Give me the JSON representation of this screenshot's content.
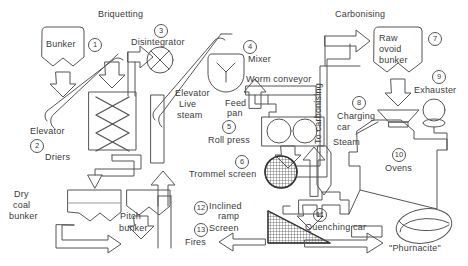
{
  "diagram": {
    "title_left": "Briquetting",
    "title_right": "Carbonising",
    "stroke_color": "#555555",
    "text_color": "#3a3a3a",
    "background": "#ffffff",
    "width": 468,
    "height": 266
  },
  "sections": [
    {
      "name": "briquetting",
      "label": "Briquetting",
      "x": 98,
      "y": 9
    },
    {
      "name": "carbonising",
      "label": "Carbonising",
      "x": 335,
      "y": 9
    }
  ],
  "equipment": [
    {
      "key": "bunker",
      "number": "1",
      "label": "Bunker",
      "shape": "bunker-hopper"
    },
    {
      "key": "elevator1",
      "number": "",
      "label": "Elevator",
      "shape": "inclined-belt"
    },
    {
      "key": "driers",
      "number": "2",
      "label": "Driers",
      "shape": "lattice-box"
    },
    {
      "key": "disintegrator",
      "number": "3",
      "label": "Disintegrator",
      "shape": "circle-cross"
    },
    {
      "key": "elevator2",
      "number": "",
      "label": "Elevator",
      "shape": "inclined-belt"
    },
    {
      "key": "mixer",
      "number": "4",
      "label": "Mixer",
      "shape": "shield-y"
    },
    {
      "key": "live_steam",
      "number": "",
      "label": "Live\nsteam",
      "shape": "up-arrow"
    },
    {
      "key": "worm_conveyor",
      "number": "",
      "label": "Worm conveyor",
      "shape": "long-bar"
    },
    {
      "key": "feed_pan",
      "number": "",
      "label": "Feed\npan",
      "shape": "duct"
    },
    {
      "key": "roll_press",
      "number": "5",
      "label": "Roll press",
      "shape": "two-rolls-box"
    },
    {
      "key": "trommel",
      "number": "6",
      "label": "Trommel screen",
      "shape": "mesh-circle"
    },
    {
      "key": "dry_coal",
      "number": "",
      "label": "Dry\ncoal\nbunker",
      "shape": "bunker-hopper"
    },
    {
      "key": "pitch_bunker",
      "number": "",
      "label": "Pitch\nbunker",
      "shape": "bunker-hopper"
    },
    {
      "key": "raw_ovoid",
      "number": "7",
      "label": "Raw\novoid\nbunker",
      "shape": "bunker-hopper"
    },
    {
      "key": "charging_car",
      "number": "8",
      "label": "Charging\ncar",
      "shape": "bowtie"
    },
    {
      "key": "exhauster",
      "number": "9",
      "label": "Exhauster",
      "shape": "fan-circle"
    },
    {
      "key": "ovens",
      "number": "10",
      "label": "Ovens",
      "shape": "oven-outline"
    },
    {
      "key": "quenching_car",
      "number": "11",
      "label": "Quenching car",
      "shape": "car-outline"
    },
    {
      "key": "inclined_ramp",
      "number": "12",
      "label": "Inclined\nramp",
      "shape": "mesh-triangle"
    },
    {
      "key": "screen",
      "number": "13",
      "label": "Screen",
      "shape": "mesh-triangle"
    },
    {
      "key": "phurnacite",
      "number": "",
      "label": "\"Phurnacite\"",
      "shape": "ovoid"
    }
  ],
  "labels": {
    "bunker": "Bunker",
    "elevator_left": "Elevator",
    "driers": "Driers",
    "disintegrator": "Disintegrator",
    "elevator_right": "Elevator",
    "live": "Live",
    "steam_word": "steam",
    "mixer": "Mixer",
    "worm_conveyor": "Worm conveyor",
    "feed": "Feed",
    "pan": "pan",
    "roll_press": "Roll press",
    "trommel_screen": "Trommel screen",
    "dry": "Dry",
    "coal": "coal",
    "bunker_word": "bunker",
    "pitch": "Pitch",
    "pitch_bunker_word": "bunker",
    "inclined": "Inclined",
    "ramp": "ramp",
    "screen": "Screen",
    "fires": "Fires",
    "to_carbonising": "To carbonising",
    "raw": "Raw",
    "ovoid": "ovoid",
    "raw_bunker_word": "bunker",
    "exhauster": "Exhauster",
    "charging": "Charging",
    "car": "car",
    "steam2": "Steam",
    "ovens": "Ovens",
    "quenching_car": "Quenching car",
    "phurnacite": "\"Phurnacite\""
  },
  "numbers": {
    "n1": "1",
    "n2": "2",
    "n3": "3",
    "n4": "4",
    "n5": "5",
    "n6": "6",
    "n7": "7",
    "n8": "8",
    "n9": "9",
    "n10": "10",
    "n11": "11",
    "n12": "12",
    "n13": "13"
  }
}
